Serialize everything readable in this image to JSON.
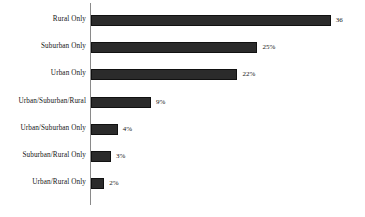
{
  "chart_data": {
    "type": "bar",
    "orientation": "horizontal",
    "title": "",
    "subtitle": "",
    "xlabel": "",
    "ylabel": "",
    "grid": false,
    "legend": null,
    "xlim": [
      0,
      38
    ],
    "axis": {
      "category_axis": "vertical-line",
      "value_axis_ticks_visible": false
    },
    "categories": [
      "Rural Only",
      "Suburban Only",
      "Urban Only",
      "Urban/Suburban/Rural",
      "Urban/Suburban Only",
      "Suburban/Rural Only",
      "Urban/Rural Only"
    ],
    "values": [
      36,
      25,
      22,
      9,
      4,
      3,
      2
    ],
    "data_labels": [
      "36",
      "25%",
      "22%",
      "9%",
      "4%",
      "3%",
      "2%"
    ],
    "bar_color": "#2b2b2b",
    "axis_color": "#8a8a8a",
    "background_color": "#ffffff"
  }
}
